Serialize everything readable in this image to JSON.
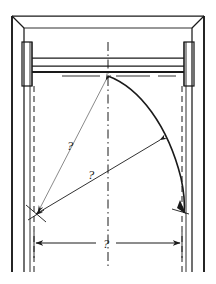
{
  "drawing": {
    "title": "Door swing clearance detail",
    "type": "engineering-line-drawing",
    "style": "hand-drawn ink on white",
    "view": "elevation / plan of door opening with swing arc",
    "canvas": {
      "width": 216,
      "height": 284,
      "background": "#ffffff"
    },
    "ink_color": "#1a1a1a",
    "secondary_ink_color": "#4a4a4a"
  },
  "labels": {
    "radius_upper": "?",
    "radius_lower": "?",
    "width_dimension": "?"
  },
  "annotations": [
    {
      "name": "radius-label-upper",
      "text": "?",
      "x": 70,
      "y": 150
    },
    {
      "name": "radius-label-lower",
      "text": "?",
      "x": 91,
      "y": 179
    },
    {
      "name": "width-label",
      "text": "?",
      "x": 104,
      "y": 249
    }
  ],
  "geometry": {
    "frame": {
      "outer_left_x": 12,
      "outer_right_x": 204,
      "outer_top_y": 16,
      "outer_bottom_y": 272,
      "inner_left_x": 24,
      "inner_right_x": 192,
      "inner_top_y": 28,
      "jamb_face_left_x": 30,
      "jamb_face_right_x": 186,
      "hidden_left_x": 33,
      "hidden_right_x": 183
    },
    "header_beam": {
      "top_y": 58,
      "bottom_y": 72,
      "left_x": 30,
      "right_x": 186
    },
    "brackets": {
      "left": {
        "x": 22,
        "y": 42,
        "width": 10,
        "height": 44
      },
      "right": {
        "x": 184,
        "y": 42,
        "width": 10,
        "height": 44
      }
    },
    "hinge_point": {
      "x": 108,
      "y": 76
    },
    "swing_arc": {
      "center_x": 108,
      "center_y": 76,
      "radius": 138,
      "start": {
        "x": 108,
        "y": 76
      },
      "end": {
        "x": 184,
        "y": 212
      }
    },
    "center_line_x": 108,
    "dimension_line": {
      "y": 243,
      "left_x": 34,
      "right_x": 182
    },
    "leaders": [
      {
        "name": "leader-radius-upper",
        "from_x": 108,
        "from_y": 78,
        "to_x": 38,
        "to_y": 214
      },
      {
        "name": "leader-radius-lower",
        "from_x": 160,
        "from_y": 142,
        "to_x": 36,
        "to_y": 216
      }
    ]
  },
  "elements": {
    "frame_outer": "door frame outer profile",
    "frame_inner": "door frame inner profile",
    "header": "header beam / lintel across opening",
    "bracket_left": "left mounting bracket",
    "bracket_right": "right mounting bracket",
    "arc": "door leaf swing arc",
    "centerline": "vertical centre line",
    "dimension": "overall clear width dimension"
  }
}
